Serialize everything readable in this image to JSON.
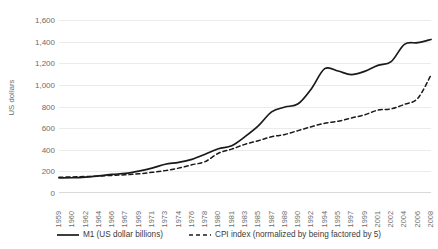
{
  "chart_data": {
    "type": "line",
    "title": "",
    "xlabel": "",
    "ylabel": "US dollars",
    "ylim": [
      0,
      1600
    ],
    "y_ticks": [
      "0",
      "200",
      "400",
      "600",
      "800",
      "1,000",
      "1,200",
      "1,400",
      "1,600"
    ],
    "y_tick_values": [
      0,
      200,
      400,
      600,
      800,
      1000,
      1200,
      1400,
      1600
    ],
    "grid": true,
    "legend_position": "bottom",
    "categories": [
      "1959",
      "1960",
      "1962",
      "1964",
      "1966",
      "1967",
      "1969",
      "1971",
      "1973",
      "1974",
      "1976",
      "1978",
      "1980",
      "1981",
      "1983",
      "1985",
      "1987",
      "1988",
      "1990",
      "1992",
      "1994",
      "1995",
      "1997",
      "1999",
      "2001",
      "2002",
      "2004",
      "2006",
      "2008"
    ],
    "series": [
      {
        "name": "M1 (US dollar billions)",
        "style": "solid",
        "color": "#1a1a1a",
        "values": [
          140,
          141,
          147,
          158,
          172,
          182,
          203,
          230,
          266,
          283,
          311,
          358,
          409,
          437,
          521,
          620,
          750,
          795,
          825,
          965,
          1150,
          1128,
          1095,
          1125,
          1180,
          1215,
          1375,
          1390,
          1420
        ]
      },
      {
        "name": "CPI index (normalized by being factored by 5)",
        "style": "dashed",
        "color": "#1a1a1a",
        "values": [
          146,
          148,
          152,
          156,
          163,
          168,
          177,
          191,
          207,
          230,
          261,
          290,
          368,
          406,
          450,
          484,
          520,
          541,
          577,
          613,
          645,
          663,
          694,
          723,
          766,
          778,
          820,
          875,
          1090
        ]
      }
    ]
  },
  "legend": {
    "items": [
      {
        "label": "M1 (US dollar billions)",
        "style": "solid"
      },
      {
        "label": "CPI index (normalized by being factored by 5)",
        "style": "dashed"
      }
    ]
  }
}
